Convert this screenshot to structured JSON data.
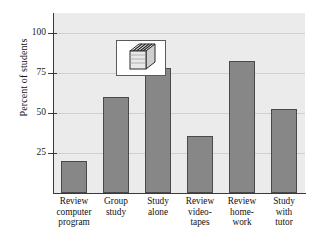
{
  "chart_data": {
    "type": "bar",
    "title": "",
    "xlabel": "",
    "ylabel": "Percent of students",
    "ylim": [
      0,
      112
    ],
    "yticks": [
      25,
      50,
      75,
      100
    ],
    "ytick_labels": [
      "25",
      "50",
      "75",
      "100"
    ],
    "grid": true,
    "legend": "none",
    "categories": [
      "Review computer program",
      "Group study",
      "Study alone",
      "Review video-tapes",
      "Review home-work",
      "Study with tutor"
    ],
    "category_lines": [
      [
        "Review",
        "computer",
        "program"
      ],
      [
        "Group",
        "study"
      ],
      [
        "Study",
        "alone"
      ],
      [
        "Review",
        "video-",
        "tapes"
      ],
      [
        "Review",
        "home-",
        "work"
      ],
      [
        "Study",
        "with",
        "tutor"
      ]
    ],
    "values": [
      20,
      60,
      78,
      35.5,
      82.5,
      52.5
    ],
    "bar_color": "#878787",
    "bar_edge_color": "#4a4a4a",
    "plot_background": "#ebebeb",
    "gridline_color": "#cfcfcf",
    "axis_color": "#3a3a3a"
  },
  "decoration": {
    "icon_name": "stack-of-books-icon",
    "icon_box_background": "#ffffff",
    "icon_box_border": "#5a5a5a"
  }
}
